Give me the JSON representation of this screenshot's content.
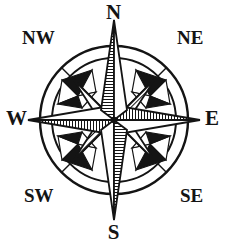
{
  "figure": {
    "kind": "compass-rose",
    "background_color": "#ffffff",
    "ink_color": "#141414"
  },
  "labels": {
    "north": "N",
    "south": "S",
    "east": "E",
    "west": "W",
    "northwest": "NW",
    "northeast": "NE",
    "southwest": "SW",
    "southeast": "SE"
  },
  "geometry": {
    "center_x": 114,
    "center_y": 120,
    "outer_ring_radius": 74,
    "inner_ring_radius": 62,
    "cardinal_point_length": 105,
    "ordinal_point_length": 58,
    "hub_radius": 5
  },
  "shading": {
    "north_arm": "left-hatched",
    "south_arm": "right-hatched",
    "east_arm": "upper-hatched",
    "west_arm": "lower-hatched",
    "ring_ornaments": "black-triangles"
  }
}
